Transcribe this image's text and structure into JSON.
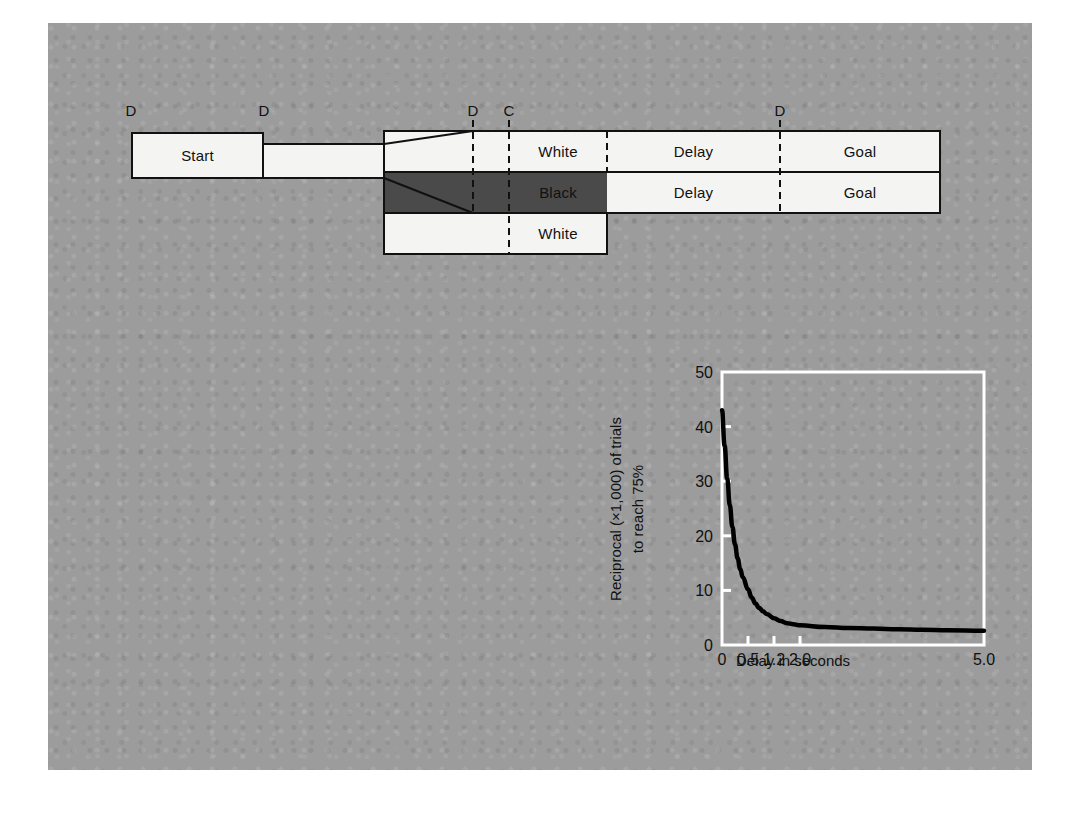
{
  "figure": {
    "background_color": "#9c9c9c",
    "page_color": "#ffffff"
  },
  "diagram": {
    "name": "trial-sequence-diagram",
    "start_box": {
      "label": "Start"
    },
    "event_markers": [
      {
        "id": "d-start-left",
        "label": "D"
      },
      {
        "id": "d-start-right",
        "label": "D"
      },
      {
        "id": "d-stimulus",
        "label": "D"
      },
      {
        "id": "c-choice",
        "label": "C"
      },
      {
        "id": "d-goal",
        "label": "D"
      }
    ],
    "rows": [
      {
        "id": "row-top",
        "cells": [
          {
            "id": "cell-white-top",
            "label": "White",
            "fill": "white"
          },
          {
            "id": "cell-delay-top",
            "label": "Delay",
            "fill": "white"
          },
          {
            "id": "cell-goal-top",
            "label": "Goal",
            "fill": "white"
          }
        ]
      },
      {
        "id": "row-middle",
        "cells": [
          {
            "id": "cell-black-mid",
            "label": "Black",
            "fill": "black"
          },
          {
            "id": "cell-delay-mid",
            "label": "Delay",
            "fill": "white"
          },
          {
            "id": "cell-goal-mid",
            "label": "Goal",
            "fill": "white"
          }
        ]
      },
      {
        "id": "row-bottom",
        "cells": [
          {
            "id": "cell-white-bottom",
            "label": "White",
            "fill": "white"
          }
        ]
      }
    ],
    "colors": {
      "white_fill": "#f4f4f2",
      "black_fill": "#4a4a4a",
      "stroke": "#111111"
    }
  },
  "chart_data": {
    "type": "line",
    "title": "",
    "xlabel": "Delay in seconds",
    "ylabel": "Reciprocal (×1,000) of trials to reach 75%",
    "ylabel_line1": "Reciprocal (×1,000) of trials",
    "ylabel_line2": "to reach 75%",
    "x_tick_labels": [
      "0",
      "0.5",
      "1.2",
      "2.0",
      "5.0"
    ],
    "x_tick_values": [
      0,
      0.5,
      1.2,
      2.0,
      5.0
    ],
    "y_tick_labels": [
      "0",
      "10",
      "20",
      "30",
      "40",
      "50"
    ],
    "y_tick_values": [
      0,
      10,
      20,
      30,
      40,
      50
    ],
    "xlim": [
      0,
      5.0
    ],
    "ylim": [
      0,
      50
    ],
    "grid": false,
    "legend": "none",
    "frame_color": "#ffffff",
    "line_color": "#000000",
    "x": [
      0.0,
      0.05,
      0.1,
      0.15,
      0.2,
      0.25,
      0.3,
      0.35,
      0.4,
      0.5,
      0.6,
      0.7,
      0.8,
      0.9,
      1.0,
      1.2,
      1.4,
      1.6,
      1.8,
      2.0,
      2.4,
      2.8,
      3.2,
      3.6,
      4.0,
      4.4,
      5.0
    ],
    "values": [
      43.0,
      36.5,
      30.5,
      25.6,
      21.6,
      18.4,
      15.9,
      13.9,
      12.4,
      10.2,
      8.7,
      7.6,
      6.8,
      6.2,
      5.7,
      4.9,
      4.4,
      4.0,
      3.8,
      3.6,
      3.3,
      3.1,
      3.0,
      2.9,
      2.8,
      2.7,
      2.6
    ]
  }
}
